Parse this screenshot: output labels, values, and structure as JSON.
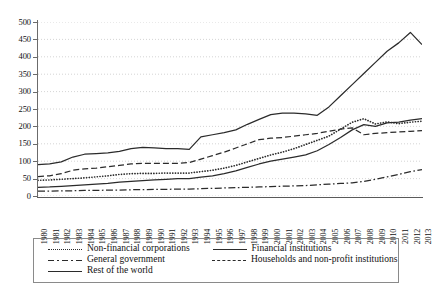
{
  "chart": {
    "type": "line",
    "title": "",
    "xlabel": "",
    "ylabel": "",
    "ylim": [
      0,
      500
    ],
    "ytick_step": 50,
    "grid": "horizontal-dotted",
    "legend_position": "below-plot"
  },
  "axis": {
    "y_ticks": [
      "500",
      "450",
      "400",
      "350",
      "300",
      "250",
      "200",
      "150",
      "100",
      "50",
      "0"
    ],
    "x_ticks": [
      "1980",
      "1981",
      "1982",
      "1983",
      "1984",
      "1985",
      "1986",
      "1987",
      "1988",
      "1989",
      "1990",
      "1991",
      "1992",
      "1993",
      "1994",
      "1995",
      "1996",
      "1997",
      "1998",
      "1999",
      "2000",
      "2001",
      "2002",
      "2003",
      "2004",
      "2005",
      "2006",
      "2007",
      "2008",
      "2009",
      "2010",
      "2011",
      "2012",
      "2013"
    ]
  },
  "legend": {
    "items": [
      {
        "label": "Non-financial corporations",
        "style": "dotted",
        "color": "#2b2b2b"
      },
      {
        "label": "Financial institutions",
        "style": "solid",
        "color": "#2b2b2b"
      },
      {
        "label": "General government",
        "style": "dash-dot",
        "color": "#2b2b2b"
      },
      {
        "label": "Households and non-profit institutions",
        "style": "dashed",
        "color": "#2b2b2b"
      },
      {
        "label": "Rest of the world",
        "style": "solid",
        "color": "#2b2b2b"
      }
    ]
  },
  "chart_data": {
    "type": "line",
    "title": "",
    "xlabel": "",
    "ylabel": "",
    "ylim": [
      0,
      500
    ],
    "xlim": [
      1980,
      2013
    ],
    "grid": true,
    "legend_position": "bottom",
    "x": [
      1980,
      1981,
      1982,
      1983,
      1984,
      1985,
      1986,
      1987,
      1988,
      1989,
      1990,
      1991,
      1992,
      1993,
      1994,
      1995,
      1996,
      1997,
      1998,
      1999,
      2000,
      2001,
      2002,
      2003,
      2004,
      2005,
      2006,
      2007,
      2008,
      2009,
      2010,
      2011,
      2012,
      2013
    ],
    "categories": [
      "1980",
      "1981",
      "1982",
      "1983",
      "1984",
      "1985",
      "1986",
      "1987",
      "1988",
      "1989",
      "1990",
      "1991",
      "1992",
      "1993",
      "1994",
      "1995",
      "1996",
      "1997",
      "1998",
      "1999",
      "2000",
      "2001",
      "2002",
      "2003",
      "2004",
      "2005",
      "2006",
      "2007",
      "2008",
      "2009",
      "2010",
      "2011",
      "2012",
      "2013"
    ],
    "series": [
      {
        "name": "Non-financial corporations",
        "style": "dotted",
        "values": [
          45,
          46,
          48,
          50,
          52,
          55,
          58,
          62,
          64,
          65,
          65,
          66,
          66,
          66,
          70,
          74,
          80,
          88,
          98,
          108,
          118,
          126,
          136,
          148,
          160,
          172,
          192,
          212,
          222,
          207,
          213,
          208,
          212,
          215
        ]
      },
      {
        "name": "Financial institutions",
        "style": "solid",
        "values": [
          25,
          26,
          28,
          30,
          32,
          34,
          36,
          40,
          42,
          44,
          46,
          48,
          50,
          50,
          54,
          58,
          64,
          72,
          82,
          92,
          100,
          106,
          112,
          118,
          130,
          148,
          168,
          190,
          205,
          200,
          210,
          212,
          218,
          222
        ]
      },
      {
        "name": "General government",
        "style": "dash-dot",
        "values": [
          14,
          14,
          15,
          15,
          16,
          16,
          17,
          17,
          18,
          18,
          19,
          19,
          20,
          20,
          21,
          22,
          23,
          24,
          25,
          26,
          27,
          28,
          29,
          30,
          32,
          34,
          36,
          38,
          42,
          48,
          55,
          62,
          70,
          76
        ]
      },
      {
        "name": "Households and non-profit institutions",
        "style": "dashed",
        "values": [
          56,
          58,
          64,
          74,
          78,
          80,
          84,
          88,
          92,
          94,
          94,
          94,
          94,
          96,
          106,
          116,
          126,
          138,
          150,
          162,
          166,
          168,
          172,
          176,
          180,
          186,
          192,
          196,
          176,
          180,
          182,
          184,
          186,
          188
        ]
      },
      {
        "name": "Rest of the world",
        "style": "solid",
        "values": [
          90,
          92,
          98,
          112,
          120,
          122,
          124,
          128,
          136,
          140,
          138,
          136,
          136,
          134,
          170,
          176,
          182,
          190,
          206,
          220,
          234,
          238,
          238,
          236,
          232,
          256,
          288,
          320,
          352,
          384,
          416,
          440,
          470,
          435
        ]
      }
    ]
  }
}
